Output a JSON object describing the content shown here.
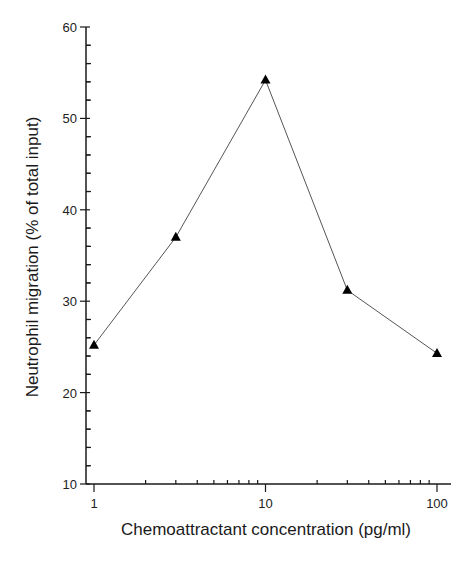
{
  "chart_data": {
    "type": "line",
    "title": "",
    "xlabel": "Chemoattractant concentration (pg/ml)",
    "ylabel": "Neutrophil migration (% of total input)",
    "x_scale": "log",
    "xlim": [
      1,
      100
    ],
    "ylim": [
      10,
      60
    ],
    "x_ticks": [
      1,
      10,
      100
    ],
    "x_tick_labels": [
      "1",
      "10",
      "100"
    ],
    "y_ticks": [
      10,
      20,
      30,
      40,
      50,
      60
    ],
    "y_tick_labels": [
      "10",
      "20",
      "30",
      "40",
      "50",
      "60"
    ],
    "y_minor_step": 2,
    "grid": false,
    "legend": null,
    "series": [
      {
        "name": "Neutrophil migration",
        "marker": "triangle",
        "color": "#000000",
        "x": [
          1,
          3,
          10,
          30,
          100
        ],
        "values": [
          25.2,
          37.0,
          54.2,
          31.2,
          24.3
        ]
      }
    ]
  },
  "colors": {
    "axis": "#1a1a1a",
    "line": "#555555",
    "marker": "#000000"
  }
}
